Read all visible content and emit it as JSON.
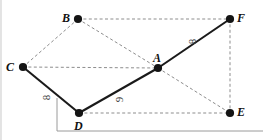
{
  "figure": {
    "type": "geometry-graph-diagram",
    "canvas": {
      "width": 263,
      "height": 140,
      "background": "#ffffff"
    },
    "colors": {
      "solid_edge": "#1a1a1a",
      "dashed_edge": "#8d8d8d",
      "vertex_fill": "#141414",
      "label_text": "#111111",
      "weight_text": "#3a3a3a",
      "rule_line": "#9a9a9a"
    },
    "vertices": [
      {
        "id": "A",
        "label": "A",
        "x": 158,
        "y": 68,
        "label_dx": -5,
        "label_dy": -16
      },
      {
        "id": "B",
        "label": "B",
        "x": 78,
        "y": 19,
        "label_dx": -16,
        "label_dy": -7
      },
      {
        "id": "C",
        "label": "C",
        "x": 23,
        "y": 67,
        "label_dx": -17,
        "label_dy": -6
      },
      {
        "id": "D",
        "label": "D",
        "x": 79,
        "y": 113,
        "label_dx": -5,
        "label_dy": 7
      },
      {
        "id": "E",
        "label": "E",
        "x": 230,
        "y": 113,
        "label_dx": 7,
        "label_dy": -7
      },
      {
        "id": "F",
        "label": "F",
        "x": 230,
        "y": 19,
        "label_dx": 7,
        "label_dy": -7
      }
    ],
    "edges": [
      {
        "from": "C",
        "to": "D",
        "style": "solid",
        "weight": "8"
      },
      {
        "from": "D",
        "to": "A",
        "style": "solid",
        "weight": "9"
      },
      {
        "from": "A",
        "to": "F",
        "style": "solid",
        "weight": "8"
      },
      {
        "from": "B",
        "to": "F",
        "style": "dashed",
        "weight": ""
      },
      {
        "from": "B",
        "to": "C",
        "style": "dashed",
        "weight": ""
      },
      {
        "from": "B",
        "to": "A",
        "style": "dashed",
        "weight": ""
      },
      {
        "from": "C",
        "to": "A",
        "style": "dashed",
        "weight": ""
      },
      {
        "from": "A",
        "to": "E",
        "style": "dashed",
        "weight": ""
      },
      {
        "from": "D",
        "to": "E",
        "style": "dashed",
        "weight": ""
      },
      {
        "from": "F",
        "to": "E",
        "style": "dashed",
        "weight": ""
      }
    ],
    "edge_weights": [
      {
        "edge": "C-D",
        "text": "8",
        "x": 44,
        "y": 92,
        "rotated": true
      },
      {
        "edge": "D-A",
        "text": "9",
        "x": 117,
        "y": 94,
        "rotated": true
      },
      {
        "edge": "A-F",
        "text": "8",
        "x": 190,
        "y": 36,
        "rotated": true
      }
    ],
    "annotations": {
      "pointer_line": {
        "x": 57,
        "y_top": 98,
        "y_bottom": 131
      },
      "bottom_rule": {
        "x_start": 57,
        "x_end": 263,
        "y": 131
      },
      "left_rule": {
        "x": 1,
        "y_start": 0,
        "y_end": 140
      }
    }
  }
}
